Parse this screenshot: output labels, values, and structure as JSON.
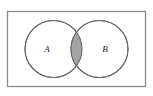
{
  "figure": {
    "kind": "venn-diagram",
    "caption": "",
    "background_color": "#ffffff"
  },
  "universe": {
    "name": "universal-set-rectangle",
    "label": "",
    "x": 7.5,
    "y": 11.5,
    "width": 138,
    "height": 75,
    "stroke_color": "#8c8c8c",
    "stroke_width": 1.3,
    "fill_color": "#ffffff"
  },
  "sets": [
    {
      "id": "A",
      "label": "A",
      "name": "circle-a",
      "cx": 53.5,
      "cy": 49,
      "r": 28.5,
      "stroke_color": "#6b6b6b",
      "stroke_width": 1.1,
      "fill_color": "#ffffff",
      "label_x": 47,
      "label_y": 50
    },
    {
      "id": "B",
      "label": "B",
      "name": "circle-b",
      "cx": 99.5,
      "cy": 49,
      "r": 28.5,
      "stroke_color": "#6b6b6b",
      "stroke_width": 1.1,
      "fill_color": "#ffffff",
      "label_x": 105,
      "label_y": 50
    }
  ],
  "intersection": {
    "name": "intersection-region",
    "label": "",
    "shaded": true,
    "fill_color": "#a3a3a3",
    "stroke_color": "#6b6b6b",
    "description": "A intersect B"
  },
  "colors": {
    "shading": "#a3a3a3",
    "circle_stroke": "#6b6b6b",
    "rect_stroke": "#8c8c8c",
    "label_text": "#1a1a1a",
    "page_background": "#ffffff"
  }
}
